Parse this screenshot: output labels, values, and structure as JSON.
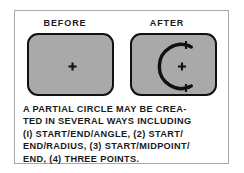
{
  "figure": {
    "headers": {
      "before": "BEFORE",
      "after": "AFTER"
    },
    "panels": {
      "before": {
        "label": "before-viewport",
        "markers": [
          {
            "name": "center-point-marker",
            "x": 43.5,
            "y": 31.5
          }
        ],
        "arc": null
      },
      "after": {
        "label": "after-viewport",
        "markers": [
          {
            "name": "arc-start-point-marker",
            "x": 54,
            "y": 10
          },
          {
            "name": "arc-center-point-marker",
            "x": 50,
            "y": 31.5
          },
          {
            "name": "arc-end-point-marker",
            "x": 54,
            "y": 53
          }
        ],
        "arc": {
          "name": "partial-circle-arc",
          "center_x": 50,
          "center_y": 31.5,
          "radius": 22,
          "start_angle_deg": 295,
          "end_angle_deg": 65,
          "direction": "opens-right"
        }
      }
    },
    "caption_lines": [
      "A PARTIAL CIRCLE MAY BE CREA-",
      "TED IN SEVERAL WAYS INCLUDING",
      "(I) START/END/ANGLE, (2) START/",
      "END/RADIUS, (3) START/MIDPOINT/",
      "END, (4) THREE POINTS."
    ],
    "colors": {
      "panel_fill": "#a9a9a9",
      "panel_border": "#111111",
      "card_border": "#a8a8a8",
      "ink": "#1a1a1a",
      "background": "#ffffff"
    }
  }
}
